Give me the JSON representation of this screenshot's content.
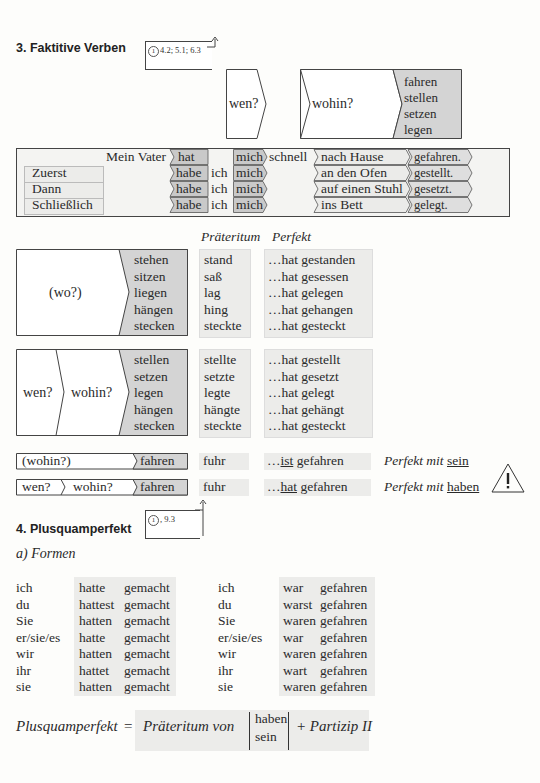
{
  "section3": {
    "title": "3.  Faktitive Verben",
    "ref": {
      "circle": "1",
      "text": "4.2; 5.1; 6.3"
    },
    "header_diagram": {
      "q1": "wen?",
      "q2": "wohin?",
      "verbs": [
        "fahren",
        "stellen",
        "setzen",
        "legen"
      ]
    },
    "sentence_table": {
      "rows": [
        {
          "adverb": "",
          "subject": "Mein Vater",
          "aux": "hat",
          "pron": "",
          "obj": "mich",
          "extra": "schnell",
          "place": "nach Hause",
          "participle": "gefahren."
        },
        {
          "adverb": "Zuerst",
          "subject": "",
          "aux": "habe",
          "pron": "ich",
          "obj": "mich",
          "extra": "",
          "place": "an den Ofen",
          "participle": "gestellt."
        },
        {
          "adverb": "Dann",
          "subject": "",
          "aux": "habe",
          "pron": "ich",
          "obj": "mich",
          "extra": "",
          "place": "auf einen Stuhl",
          "participle": "gesetzt."
        },
        {
          "adverb": "Schließlich",
          "subject": "",
          "aux": "habe",
          "pron": "ich",
          "obj": "mich",
          "extra": "",
          "place": "ins Bett",
          "participle": "gelegt."
        }
      ]
    },
    "col_headers": {
      "praeteritum": "Präteritum",
      "perfekt": "Perfekt"
    },
    "block_wo": {
      "question": "(wo?)",
      "verbs": [
        "stehen",
        "sitzen",
        "liegen",
        "hängen",
        "stecken"
      ],
      "praeteritum": [
        "stand",
        "saß",
        "lag",
        "hing",
        "steckte"
      ],
      "perfekt": [
        "…hat gestanden",
        "…hat gesessen",
        "…hat gelegen",
        "…hat gehangen",
        "…hat gesteckt"
      ]
    },
    "block_wohin": {
      "q1": "wen?",
      "q2": "wohin?",
      "verbs": [
        "stellen",
        "setzen",
        "legen",
        "hängen",
        "stecken"
      ],
      "praeteritum": [
        "stellte",
        "setzte",
        "legte",
        "hängte",
        "steckte"
      ],
      "perfekt": [
        "…hat gestellt",
        "…hat gesetzt",
        "…hat gelegt",
        "…hat gehängt",
        "…hat gesteckt"
      ]
    },
    "fahren_rows": [
      {
        "q1": "(wohin?)",
        "q2": "",
        "verb": "fahren",
        "praet": "fuhr",
        "perf_prefix": "…",
        "perf_aux": "ist",
        "perf_rest": " gefahren",
        "note": "Perfekt mit ",
        "note_aux": "sein"
      },
      {
        "q1": "wen?",
        "q2": "wohin?",
        "verb": "fahren",
        "praet": "fuhr",
        "perf_prefix": "…",
        "perf_aux": "hat",
        "perf_rest": " gefahren",
        "note": "Perfekt mit ",
        "note_aux": "haben"
      }
    ],
    "warning_icon": "!"
  },
  "section4": {
    "title": "4.  Plusquamperfekt",
    "ref": {
      "circle": "1",
      "text": ", 9.3"
    },
    "subtitle": "a)  Formen",
    "haben_table": {
      "pronouns": [
        "ich",
        "du",
        "Sie",
        "er/sie/es",
        "wir",
        "ihr",
        "sie"
      ],
      "aux": [
        "hatte",
        "hattest",
        "hatten",
        "hatte",
        "hatten",
        "hattet",
        "hatten"
      ],
      "participle": "gemacht"
    },
    "sein_table": {
      "pronouns": [
        "ich",
        "du",
        "Sie",
        "er/sie/es",
        "wir",
        "ihr",
        "sie"
      ],
      "aux": [
        "war",
        "warst",
        "waren",
        "war",
        "waren",
        "wart",
        "waren"
      ],
      "participle": "gefahren"
    },
    "formula": {
      "lhs": "Plusquamperfekt",
      "eq": "=",
      "part1": "Präteritum von",
      "aux_top": "haben",
      "aux_bottom": "sein",
      "part2": "+ Partizip II"
    }
  }
}
